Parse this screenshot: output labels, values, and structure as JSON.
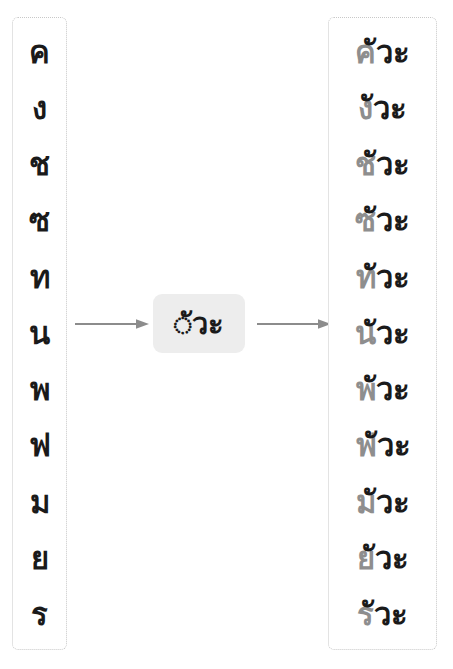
{
  "diagram": {
    "colors": {
      "base_consonant": "#8e8e8e",
      "vowel_suffix": "#1a1a1a",
      "chip_background": "#ededed",
      "arrow": "#8c8c8c",
      "column_border": "#c8c8c8",
      "page_background": "#ffffff"
    }
  },
  "source_column": {
    "name": "consonants",
    "items": [
      {
        "char": "ค"
      },
      {
        "char": "ง"
      },
      {
        "char": "ช"
      },
      {
        "char": "ซ"
      },
      {
        "char": "ท"
      },
      {
        "char": "น"
      },
      {
        "char": "พ"
      },
      {
        "char": "ฟ"
      },
      {
        "char": "ม"
      },
      {
        "char": "ย"
      },
      {
        "char": "ร"
      }
    ]
  },
  "pattern_chip": {
    "label": "◌ัวะ",
    "placeholder_glyph": "◌",
    "vowel": "ัวะ"
  },
  "arrows": {
    "left": "arrow-right-icon",
    "right": "arrow-right-icon"
  },
  "result_column": {
    "name": "syllables",
    "items": [
      {
        "base": "ค",
        "suffix": "ัวะ",
        "full": "คัวะ"
      },
      {
        "base": "ง",
        "suffix": "ัวะ",
        "full": "งัวะ"
      },
      {
        "base": "ช",
        "suffix": "ัวะ",
        "full": "ชัวะ"
      },
      {
        "base": "ซ",
        "suffix": "ัวะ",
        "full": "ซัวะ"
      },
      {
        "base": "ท",
        "suffix": "ัวะ",
        "full": "ทัวะ"
      },
      {
        "base": "น",
        "suffix": "ัวะ",
        "full": "นัวะ"
      },
      {
        "base": "พ",
        "suffix": "ัวะ",
        "full": "พัวะ"
      },
      {
        "base": "ฟ",
        "suffix": "ัวะ",
        "full": "ฟัวะ"
      },
      {
        "base": "ม",
        "suffix": "ัวะ",
        "full": "มัวะ"
      },
      {
        "base": "ย",
        "suffix": "ัวะ",
        "full": "ยัวะ"
      },
      {
        "base": "ร",
        "suffix": "ัวะ",
        "full": "รัวะ"
      }
    ]
  }
}
